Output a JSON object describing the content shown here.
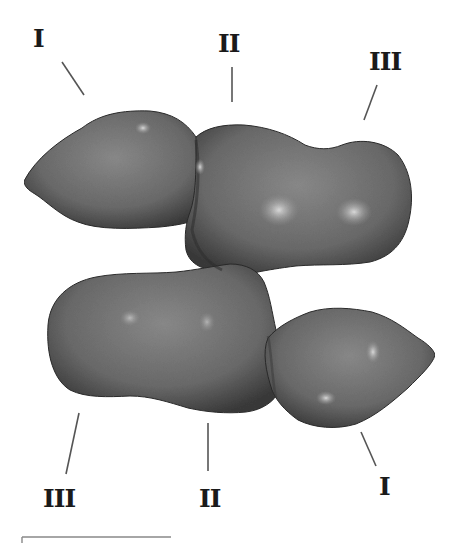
{
  "figure": {
    "labels": {
      "top_left": "I",
      "top_middle": "II",
      "top_right": "III",
      "bottom_left": "III",
      "bottom_middle": "II",
      "bottom_right": "I"
    },
    "colors": {
      "body_mid": "#727272",
      "body_dark": "#2e2e2e",
      "body_light": "#9a9a9a",
      "highlight": "#d4d4d4",
      "leader_line": "#555555",
      "scale_bar": "#888888",
      "background": "#ffffff"
    },
    "scale_bar": {
      "visible": true
    }
  }
}
